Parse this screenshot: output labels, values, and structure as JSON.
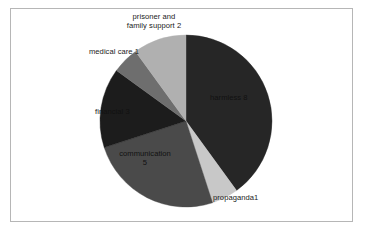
{
  "chart_data": {
    "type": "pie",
    "title": "",
    "subtitle": "",
    "xlabel": "",
    "ylabel": "",
    "legend_position": "none",
    "grid": false,
    "total": 20,
    "categories": [
      "harmless",
      "propaganda",
      "communication",
      "financial",
      "medical care",
      "prisoner and family support"
    ],
    "values": [
      8,
      1,
      5,
      3,
      1,
      2
    ],
    "labels": [
      "harmless 8",
      "propaganda1",
      "communication\n5",
      "financial 3",
      "medical care 1",
      "prisoner and\nfamily support 2"
    ],
    "slices": [
      {
        "name": "harmless",
        "label_line1": "harmless 8",
        "label_line2": "",
        "value": 8,
        "percent": 40,
        "color": "#262626",
        "start_angle_deg": 0,
        "end_angle_deg": 144,
        "label_placement": "inside"
      },
      {
        "name": "propaganda",
        "label_line1": "propaganda1",
        "label_line2": "",
        "value": 1,
        "percent": 5,
        "color": "#c8c8c8",
        "start_angle_deg": 144,
        "end_angle_deg": 162,
        "label_placement": "outside"
      },
      {
        "name": "communication",
        "label_line1": "communication",
        "label_line2": "5",
        "value": 5,
        "percent": 25,
        "color": "#4a4a4a",
        "start_angle_deg": 162,
        "end_angle_deg": 252,
        "label_placement": "inside"
      },
      {
        "name": "financial",
        "label_line1": "financial 3",
        "label_line2": "",
        "value": 3,
        "percent": 15,
        "color": "#1c1c1c",
        "start_angle_deg": 252,
        "end_angle_deg": 306,
        "label_placement": "inside"
      },
      {
        "name": "medical care",
        "label_line1": "medical care 1",
        "label_line2": "",
        "value": 1,
        "percent": 5,
        "color": "#6e6e6e",
        "start_angle_deg": 306,
        "end_angle_deg": 324,
        "label_placement": "outside"
      },
      {
        "name": "prisoner and family support",
        "label_line1": "prisoner and",
        "label_line2": "family support 2",
        "value": 2,
        "percent": 10,
        "color": "#b0b0b0",
        "start_angle_deg": 324,
        "end_angle_deg": 360,
        "label_placement": "outside"
      }
    ],
    "geometry": {
      "center_x": 186,
      "center_y": 121,
      "radius": 86
    },
    "frame_color": "#b6b6b6",
    "background_color": "#ffffff"
  }
}
